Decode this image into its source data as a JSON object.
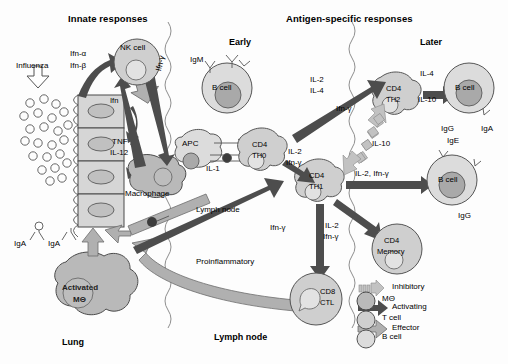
{
  "figure": {
    "headers": {
      "innate": "Innate responses",
      "antigen_specific": "Antigen-specific responses"
    },
    "phases": {
      "early": "Early",
      "later": "Later"
    }
  },
  "compartments": {
    "lung": "Lung",
    "lymph_node_mid": "Lymph node",
    "lymph_node_bottom": "Lymph node"
  },
  "innate": {
    "pathogen": "Influenza",
    "epithelium_cytokine": "Ifn",
    "antibodies": {
      "iga_left": "IgA",
      "iga_right": "IgA"
    },
    "nk_cell": "NK cell",
    "macrophage": "Macrophage",
    "activated_mac": {
      "line1": "Activated",
      "line2": "MΘ"
    },
    "cytokines": {
      "ifn_alpha": "Ifn-α",
      "ifn_beta": "Ifn-β",
      "ifn_gamma": "Ifn-γ",
      "tnf": "TNF",
      "il12": "IL-12"
    }
  },
  "adaptive": {
    "b_cell_early": {
      "label": "B cell",
      "surface_ig": "IgM"
    },
    "apc": {
      "label": "APC",
      "cytokine": "IL-1"
    },
    "th0": {
      "line1": "CD4",
      "line2": "TH0"
    },
    "th1": {
      "line1": "CD4",
      "line2": "TH1"
    },
    "th2": {
      "line1": "CD4",
      "line2": "TH2"
    },
    "memory": {
      "line1": "CD4",
      "line2": "Memory"
    },
    "ctl": {
      "line1": "CD8",
      "line2": "CTL"
    },
    "b_cell_th2": {
      "label": "B cell",
      "ig": [
        "IgG",
        "IgE",
        "IgA"
      ]
    },
    "b_cell_th1": {
      "label": "B cell",
      "ig": [
        "IgG"
      ]
    },
    "signals": {
      "th0_to_th2": [
        "IL-2",
        "IL-4"
      ],
      "th0_to_th1": [
        "IL-2",
        "Ifn-γ"
      ],
      "th2_to_b": [
        "IL-4",
        "IL-10"
      ],
      "th1_to_b": "IL-2, Ifn-γ",
      "th1_down": [
        "IL-2",
        "Ifn-γ"
      ],
      "inhibit_up": "Ifn-γ",
      "inhibit_down": "IL-10",
      "proinflammatory": "Proinflammatory",
      "ifn_gamma_effector": "Ifn-γ"
    }
  },
  "legend": {
    "arrows": [
      {
        "name": "inhibitory",
        "label": "Inhibitory"
      },
      {
        "name": "activating",
        "label": "Activating"
      },
      {
        "name": "effector",
        "label": "Effector"
      }
    ],
    "cells": [
      {
        "name": "macrophage",
        "label": "MΘ",
        "color": "#b0b0b0"
      },
      {
        "name": "t-cell",
        "label": "T cell",
        "color": "#cccccc"
      },
      {
        "name": "b-cell",
        "label": "B cell",
        "color": "#dedede"
      }
    ]
  }
}
